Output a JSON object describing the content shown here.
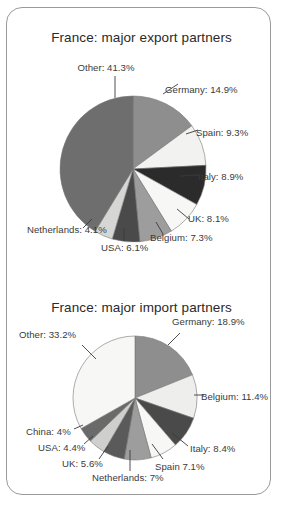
{
  "frame": {
    "label": "rounded-card-border"
  },
  "charts": [
    {
      "id": "export",
      "title": "France: major export partners",
      "labels": [
        "Other: 41.3%",
        "Germany: 14.9%",
        "Spain: 9.3%",
        "Italy: 8.9%",
        "UK: 8.1%",
        "Belgium: 7.3%",
        "USA: 6.1%",
        "Netherlands: 4.1%"
      ]
    },
    {
      "id": "import",
      "title": "France: major import partners",
      "labels": [
        "Other: 33.2%",
        "Germany: 18.9%",
        "Belgium: 11.4%",
        "Italy: 8.4%",
        "Spain 7.1%",
        "Netherlands: 7%",
        "UK: 5.6%",
        "USA: 4.4%",
        "China: 4%"
      ]
    }
  ],
  "chart_data": [
    {
      "type": "pie",
      "title": "France: major export partners",
      "xlabel": "",
      "ylabel": "",
      "legend": "none",
      "labels_position": "outside-with-leader-lines",
      "units": "percent",
      "categories": [
        "Germany",
        "Spain",
        "Italy",
        "UK",
        "Belgium",
        "USA",
        "Netherlands",
        "Other"
      ],
      "values": [
        14.9,
        9.3,
        8.9,
        8.1,
        7.3,
        6.1,
        4.1,
        41.3
      ],
      "data_labels": [
        "Germany: 14.9%",
        "Spain: 9.3%",
        "Italy: 8.9%",
        "UK: 8.1%",
        "Belgium: 7.3%",
        "USA: 6.1%",
        "Netherlands: 4.1%",
        "Other: 41.3%"
      ],
      "colors": [
        "#8e8e8e",
        "#f2f2f0",
        "#2b2b2b",
        "#f7f7f5",
        "#9d9d9d",
        "#4a4a4a",
        "#d6d6d4",
        "#6e6e6e"
      ],
      "start_angle_deg": 0,
      "direction": "clockwise"
    },
    {
      "type": "pie",
      "title": "France: major import partners",
      "xlabel": "",
      "ylabel": "",
      "legend": "none",
      "labels_position": "outside-with-leader-lines",
      "units": "percent",
      "categories": [
        "Germany",
        "Belgium",
        "Italy",
        "Spain",
        "Netherlands",
        "UK",
        "USA",
        "China",
        "Other"
      ],
      "values": [
        18.9,
        11.4,
        8.4,
        7.1,
        7.0,
        5.6,
        4.4,
        4.0,
        33.2
      ],
      "data_labels": [
        "Germany: 18.9%",
        "Belgium: 11.4%",
        "Italy: 8.4%",
        "Spain 7.1%",
        "Netherlands: 7%",
        "UK: 5.6%",
        "USA: 4.4%",
        "China: 4%",
        "Other: 33.2%"
      ],
      "colors": [
        "#8e8e8e",
        "#eeeeec",
        "#4a4a4a",
        "#f7f7f5",
        "#9d9d9d",
        "#5a5a5a",
        "#cfcfcd",
        "#6a6a6a",
        "#f7f7f5"
      ],
      "start_angle_deg": 0,
      "direction": "clockwise"
    }
  ]
}
